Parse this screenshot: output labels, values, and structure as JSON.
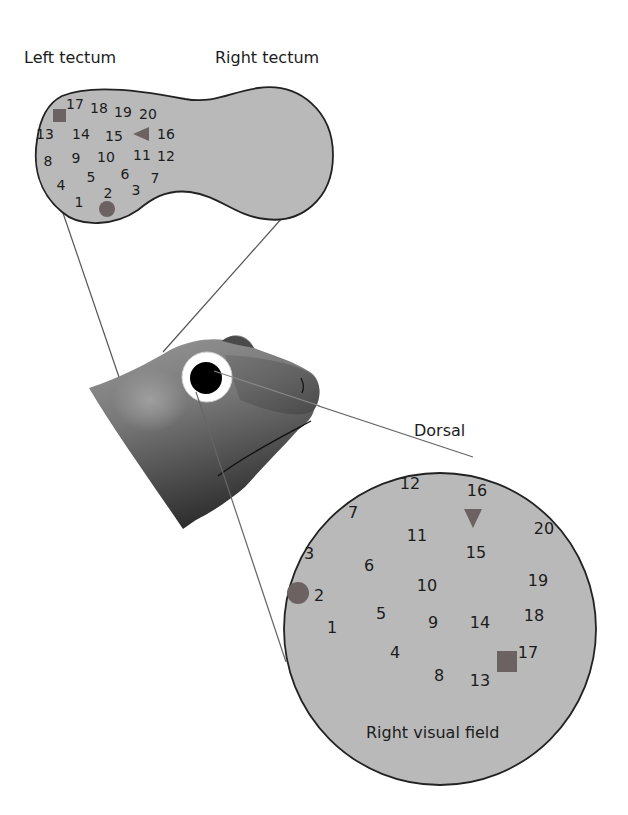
{
  "labels": {
    "left_tectum": "Left tectum",
    "right_tectum": "Right tectum",
    "dorsal": "Dorsal",
    "right_visual_field": "Right visual field"
  },
  "colors": {
    "fill_gray": "#b9b9b9",
    "outline": "#222222",
    "marker": "#6d6262",
    "head_light": "#8c8c8c",
    "head_dark": "#3a3a3a",
    "pupil": "#000000",
    "eye_ring": "#ffffff",
    "projection_line": "#555555"
  },
  "markers": {
    "circle": "circle-marker",
    "square": "square-marker",
    "triangle": "triangle-marker"
  },
  "tectum_points": [
    {
      "n": "1",
      "x": 79,
      "y": 202
    },
    {
      "n": "2",
      "x": 108,
      "y": 193
    },
    {
      "n": "3",
      "x": 136,
      "y": 190
    },
    {
      "n": "4",
      "x": 61,
      "y": 185
    },
    {
      "n": "5",
      "x": 91,
      "y": 177
    },
    {
      "n": "6",
      "x": 125,
      "y": 174
    },
    {
      "n": "7",
      "x": 155,
      "y": 178
    },
    {
      "n": "8",
      "x": 48,
      "y": 161
    },
    {
      "n": "9",
      "x": 76,
      "y": 158
    },
    {
      "n": "10",
      "x": 106,
      "y": 157
    },
    {
      "n": "11",
      "x": 142,
      "y": 155
    },
    {
      "n": "12",
      "x": 166,
      "y": 156
    },
    {
      "n": "13",
      "x": 45,
      "y": 134
    },
    {
      "n": "14",
      "x": 81,
      "y": 134
    },
    {
      "n": "15",
      "x": 114,
      "y": 136
    },
    {
      "n": "16",
      "x": 166,
      "y": 134
    },
    {
      "n": "17",
      "x": 75,
      "y": 104
    },
    {
      "n": "18",
      "x": 99,
      "y": 108
    },
    {
      "n": "19",
      "x": 123,
      "y": 112
    },
    {
      "n": "20",
      "x": 148,
      "y": 114
    }
  ],
  "tectum_markers": {
    "circle": {
      "x": 107,
      "y": 209,
      "r": 8
    },
    "square": {
      "x": 53,
      "y": 109,
      "w": 13,
      "h": 13
    },
    "triangle_left": {
      "tip_x": 133,
      "tip_y": 134,
      "base_x": 149,
      "half": 7
    }
  },
  "field_points": [
    {
      "n": "1",
      "x": 332,
      "y": 627
    },
    {
      "n": "2",
      "x": 319,
      "y": 595
    },
    {
      "n": "3",
      "x": 309,
      "y": 553
    },
    {
      "n": "4",
      "x": 395,
      "y": 652
    },
    {
      "n": "5",
      "x": 381,
      "y": 613
    },
    {
      "n": "6",
      "x": 369,
      "y": 565
    },
    {
      "n": "7",
      "x": 353,
      "y": 512
    },
    {
      "n": "8",
      "x": 439,
      "y": 675
    },
    {
      "n": "9",
      "x": 433,
      "y": 622
    },
    {
      "n": "10",
      "x": 427,
      "y": 585
    },
    {
      "n": "11",
      "x": 417,
      "y": 535
    },
    {
      "n": "12",
      "x": 410,
      "y": 483
    },
    {
      "n": "13",
      "x": 480,
      "y": 680
    },
    {
      "n": "14",
      "x": 480,
      "y": 622
    },
    {
      "n": "15",
      "x": 476,
      "y": 552
    },
    {
      "n": "16",
      "x": 477,
      "y": 490
    },
    {
      "n": "17",
      "x": 528,
      "y": 652
    },
    {
      "n": "18",
      "x": 534,
      "y": 615
    },
    {
      "n": "19",
      "x": 538,
      "y": 580
    },
    {
      "n": "20",
      "x": 544,
      "y": 528
    }
  ],
  "field_markers": {
    "circle": {
      "x": 298,
      "y": 593,
      "r": 11
    },
    "square": {
      "x": 497,
      "y": 651,
      "w": 20,
      "h": 21
    },
    "triangle_down": {
      "cx": 473,
      "top_y": 509,
      "bottom_y": 528,
      "half": 9
    }
  }
}
